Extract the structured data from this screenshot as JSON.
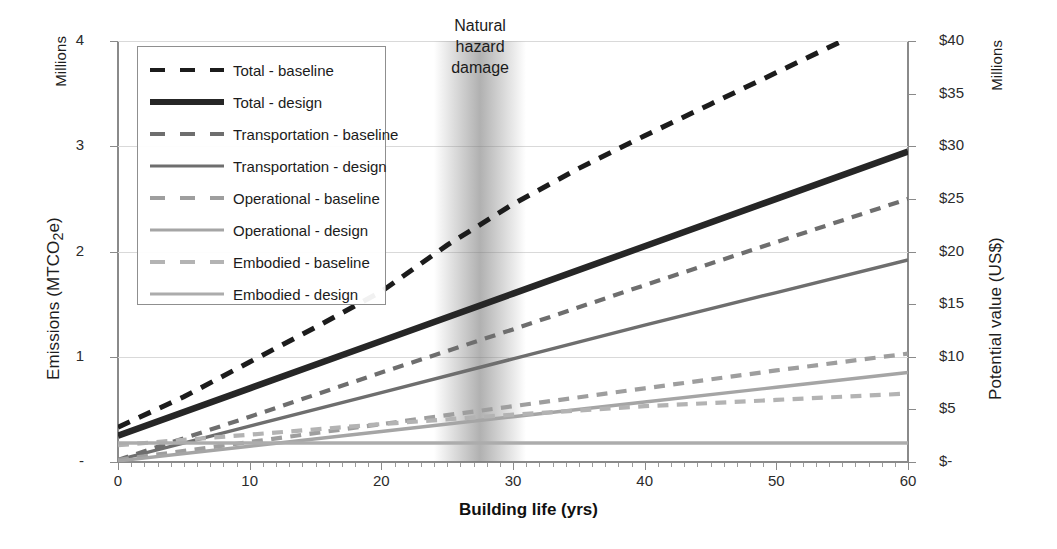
{
  "chart_data": {
    "type": "line",
    "title": "",
    "xlabel": "Building life (yrs)",
    "ylabel": "Emissions (MTCO2e)",
    "ylabel_secondary": "Potential value (US$)",
    "y_units": "Millions",
    "y_units_secondary": "Millions",
    "xlim": [
      0,
      60
    ],
    "ylim": [
      0,
      4
    ],
    "ylim_secondary": [
      0,
      40
    ],
    "grid": true,
    "legend_position": "upper-left",
    "x_ticks": [
      "0",
      "10",
      "20",
      "30",
      "40",
      "50",
      "60"
    ],
    "x_tick_values": [
      0,
      10,
      20,
      30,
      40,
      50,
      60
    ],
    "y_ticks_left": [
      "4",
      "3",
      "2",
      "1",
      "-"
    ],
    "y_tick_values_left": [
      4,
      3,
      2,
      1,
      0
    ],
    "y_ticks_right": [
      "$40",
      "$35",
      "$30",
      "$25",
      "$20",
      "$15",
      "$10",
      "$5",
      "$-"
    ],
    "y_tick_values_right": [
      40,
      35,
      30,
      25,
      20,
      15,
      10,
      5,
      0
    ],
    "annotations": [
      {
        "name": "natural-hazard-band",
        "lines": [
          "Natural",
          "hazard",
          "damage"
        ],
        "x_start": 24,
        "x_end": 31,
        "x_center": 27.5
      }
    ],
    "series": [
      {
        "name": "Total - baseline",
        "style": "dashed",
        "color": "#1c1c1c",
        "width": 5.0,
        "x": [
          0,
          5,
          10,
          15,
          20,
          25,
          30,
          35,
          40,
          45,
          50,
          55
        ],
        "values": [
          0.33,
          0.62,
          0.95,
          1.28,
          1.62,
          2.06,
          2.45,
          2.79,
          3.1,
          3.4,
          3.7,
          4.0
        ]
      },
      {
        "name": "Total - design",
        "style": "solid",
        "color": "#262626",
        "width": 6.5,
        "x": [
          0,
          10,
          20,
          30,
          40,
          50,
          60
        ],
        "values": [
          0.25,
          0.7,
          1.15,
          1.6,
          2.05,
          2.5,
          2.95
        ]
      },
      {
        "name": "Transportation - baseline",
        "style": "dashed",
        "color": "#6e6e6e",
        "width": 4.2,
        "x": [
          0,
          10,
          20,
          30,
          40,
          50,
          60
        ],
        "values": [
          0.02,
          0.43,
          0.85,
          1.26,
          1.68,
          2.09,
          2.5
        ]
      },
      {
        "name": "Transportation - design",
        "style": "solid",
        "color": "#6e6e6e",
        "width": 3.4,
        "x": [
          0,
          10,
          20,
          30,
          40,
          50,
          60
        ],
        "values": [
          0.02,
          0.34,
          0.66,
          0.98,
          1.3,
          1.61,
          1.92
        ]
      },
      {
        "name": "Operational - baseline",
        "style": "dashed",
        "color": "#9e9e9e",
        "width": 4.2,
        "x": [
          0,
          10,
          20,
          30,
          40,
          50,
          60
        ],
        "values": [
          0.02,
          0.19,
          0.36,
          0.53,
          0.7,
          0.87,
          1.03
        ]
      },
      {
        "name": "Operational - design",
        "style": "solid",
        "color": "#a5a5a5",
        "width": 3.4,
        "x": [
          0,
          10,
          20,
          30,
          40,
          50,
          60
        ],
        "values": [
          0.01,
          0.15,
          0.29,
          0.43,
          0.57,
          0.71,
          0.85
        ]
      },
      {
        "name": "Embodied - baseline",
        "style": "dashed",
        "color": "#b3b3b3",
        "width": 4.2,
        "x": [
          0,
          10,
          20,
          30,
          40,
          50,
          60
        ],
        "values": [
          0.16,
          0.26,
          0.36,
          0.45,
          0.53,
          0.59,
          0.65
        ]
      },
      {
        "name": "Embodied - design",
        "style": "solid",
        "color": "#acacac",
        "width": 3.4,
        "x": [
          0,
          10,
          20,
          30,
          40,
          50,
          60
        ],
        "values": [
          0.18,
          0.18,
          0.18,
          0.18,
          0.18,
          0.18,
          0.18
        ]
      }
    ]
  },
  "legend": {
    "items": [
      {
        "label": "Total - baseline"
      },
      {
        "label": "Total - design"
      },
      {
        "label": "Transportation - baseline"
      },
      {
        "label": "Transportation - design"
      },
      {
        "label": "Operational - baseline"
      },
      {
        "label": "Operational - design"
      },
      {
        "label": "Embodied - baseline"
      },
      {
        "label": "Embodied - design"
      }
    ]
  }
}
